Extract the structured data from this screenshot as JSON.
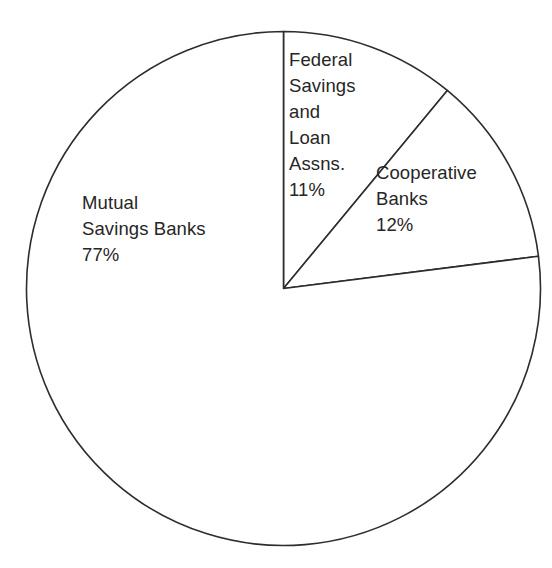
{
  "chart_data": {
    "type": "pie",
    "title": "",
    "categories": [
      "Federal Savings and Loan Assns.",
      "Cooperative Banks",
      "Mutual Savings Banks"
    ],
    "values": [
      11,
      12,
      77
    ],
    "value_labels": [
      "11%",
      "12%",
      "77%"
    ],
    "units": "percent",
    "total": 100,
    "start_angle_deg": 0,
    "direction": "clockwise",
    "legend": "none",
    "grid": false,
    "slice_fill": "#ffffff",
    "slice_stroke": "#2d2d2d",
    "background": "#ffffff",
    "slices": [
      {
        "name": "Federal Savings and Loan Assns.",
        "value": 11,
        "percent_label": "11%",
        "angle_start_deg": 0,
        "angle_end_deg": 39.6,
        "label_lines": [
          "Federal",
          "Savings",
          "and",
          "Loan",
          "Assns.",
          "11%"
        ]
      },
      {
        "name": "Cooperative Banks",
        "value": 12,
        "percent_label": "12%",
        "angle_start_deg": 39.6,
        "angle_end_deg": 82.8,
        "label_lines": [
          "Cooperative",
          "Banks",
          "12%"
        ]
      },
      {
        "name": "Mutual Savings Banks",
        "value": 77,
        "percent_label": "77%",
        "angle_start_deg": 82.8,
        "angle_end_deg": 360,
        "label_lines": [
          "Mutual",
          "Savings Banks",
          "77%"
        ]
      }
    ]
  },
  "labels": {
    "federal": {
      "line1": "Federal",
      "line2": "Savings",
      "line3": "and",
      "line4": "Loan",
      "line5": "Assns.",
      "line6": "11%"
    },
    "cooperative": {
      "line1": "Cooperative",
      "line2": "Banks",
      "line3": "12%"
    },
    "mutual": {
      "line1": "Mutual",
      "line2": "Savings Banks",
      "line3": "77%"
    }
  }
}
